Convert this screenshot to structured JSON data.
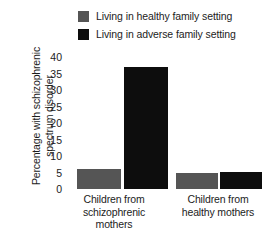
{
  "chart_data": {
    "type": "bar",
    "title": "",
    "xlabel": "",
    "ylabel": "Percentage with schizophrenic spectrum disorder",
    "ylabel_lines": [
      "Percentage with schizophrenic",
      "spectrum disorder"
    ],
    "categories": [
      "Children from schizophrenic mothers",
      "Children from healthy mothers"
    ],
    "category_lines": [
      [
        "Children from",
        "schizophrenic",
        "mothers"
      ],
      [
        "Children from",
        "healthy mothers"
      ]
    ],
    "series": [
      {
        "name": "Living in healthy family setting",
        "color": "#555555",
        "values": [
          6,
          4.8
        ]
      },
      {
        "name": "Living in adverse family setting",
        "color": "#0d0d0d",
        "values": [
          37,
          5.3
        ]
      }
    ],
    "ylim": [
      0,
      40
    ],
    "yticks": [
      0,
      5,
      10,
      15,
      20,
      25,
      30,
      35,
      40
    ],
    "ytick_labels": [
      "0",
      "5",
      "10",
      "15",
      "20",
      "25",
      "30",
      "35",
      "40"
    ],
    "grid": false,
    "legend_position": "top"
  },
  "legend": {
    "items": [
      {
        "label": "Living in healthy family setting",
        "color": "#555555",
        "swatch_name": "legend-swatch-healthy"
      },
      {
        "label": "Living in adverse family setting",
        "color": "#0d0d0d",
        "swatch_name": "legend-swatch-adverse"
      }
    ]
  },
  "colors": {
    "healthy_setting": "#555555",
    "adverse_setting": "#0d0d0d",
    "background": "#ffffff",
    "text": "#1c1c1c"
  }
}
